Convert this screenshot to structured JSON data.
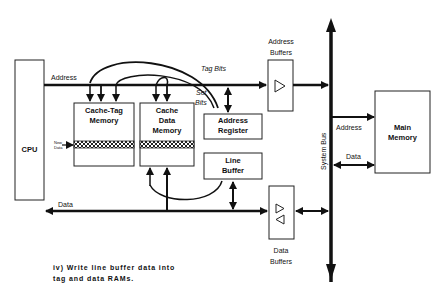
{
  "diagram": {
    "blocks": {
      "cpu": "CPU",
      "cache_tag_memory": "Cache-Tag Memory",
      "cache_tag_line1": "Cache-Tag",
      "cache_tag_line2": "Memory",
      "cache_data_line1": "Cache",
      "cache_data_line2": "Data",
      "cache_data_line3": "Memory",
      "address_register_line1": "Address",
      "address_register_line2": "Register",
      "line_buffer_line1": "Line",
      "line_buffer_line2": "Buffer",
      "main_memory_line1": "Main",
      "main_memory_line2": "Memory"
    },
    "labels": {
      "address_bus": "Address",
      "data_bus": "Data",
      "tag_bits": "Tag  Bits",
      "set_bits_line1": "Set",
      "set_bits_line2": "Bits",
      "new_data_line1": "New",
      "new_data_line2": "Data",
      "address_buffers_line1": "Address",
      "address_buffers_line2": "Buffers",
      "data_buffers_line1": "Data",
      "data_buffers_line2": "Buffers",
      "system_bus": "System Bus",
      "mem_address": "Address",
      "mem_data": "Data"
    },
    "caption_line1": "iv)  Write  line  buffer  data  into",
    "caption_line2": "tag  and  data  RAMs."
  }
}
